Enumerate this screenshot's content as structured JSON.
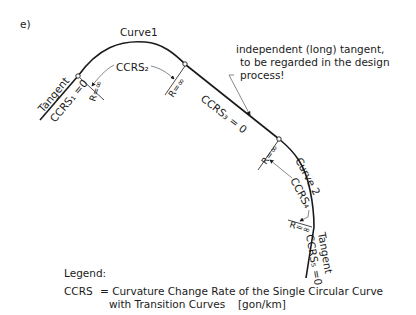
{
  "figure_label": "e)",
  "labels": {
    "curve1": "Curve1",
    "curve2": "Curve 2",
    "tangent_start": "Tangent",
    "tangent_end": "Tangent",
    "ccrs1": "CCRS₁ =0",
    "ccrs2": "CCRS₂",
    "ccrs3": "CCRS₃ = 0",
    "ccrs4": "CCRS₄",
    "ccrs5": "CCRS₅ =0",
    "r_inf_1": "R=∞",
    "r_inf_2": "R=∞",
    "r_inf_3": "R=∞",
    "r_inf_4": "R=∞"
  },
  "annotation": {
    "line1": "independent (long) tangent,",
    "line2": "to be regarded in the design",
    "line3": "process!"
  },
  "legend": {
    "title": "Legend:",
    "symbol": "CCRS",
    "definition_line1": "= Curvature Change Rate of the Single Circular Curve",
    "definition_line2": "with Transition Curves",
    "unit": "[gon/km]"
  },
  "colors": {
    "line": "#1a1a1a",
    "leader": "#555555",
    "background": "#ffffff"
  }
}
